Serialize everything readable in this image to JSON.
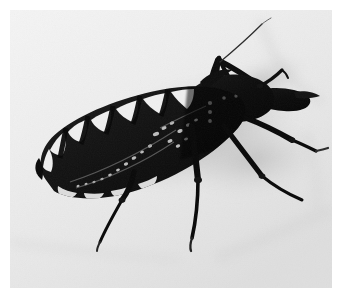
{
  "page": {
    "background_color": "#ffffff",
    "width": 340,
    "height": 298
  },
  "photo": {
    "kind": "photograph",
    "subject": "triatomine-assassin-bug",
    "color_mode": "black-and-white",
    "alt_text": "Black and white photograph of a triatomine assassin bug viewed from above on a pale background",
    "caption": "",
    "frame": {
      "x": 10,
      "y": 10,
      "width": 322,
      "height": 278
    },
    "colors": {
      "background_light": "#f2f2f2",
      "background_mid": "#e2e2e2",
      "background_shadow": "#c6c6c6",
      "body_dark": "#0a0a0a",
      "body_mid": "#1d1d1d",
      "connexivum_light": "#f0f0f0",
      "vein_highlight": "#d8d8d8",
      "page_white": "#ffffff"
    },
    "parts": [
      {
        "name": "abdomen",
        "label": "Abdomen"
      },
      {
        "name": "connexivum",
        "label": "Striped connexivum margin"
      },
      {
        "name": "hemelytra",
        "label": "Forewings"
      },
      {
        "name": "pronotum",
        "label": "Pronotum / thorax"
      },
      {
        "name": "head",
        "label": "Head with rostrum"
      },
      {
        "name": "antenna",
        "label": "Antenna"
      },
      {
        "name": "foreleg",
        "label": "Foreleg"
      },
      {
        "name": "midleg",
        "label": "Mid leg"
      },
      {
        "name": "hindleg",
        "label": "Hind leg"
      },
      {
        "name": "shadow",
        "label": "Cast shadow"
      }
    ]
  }
}
